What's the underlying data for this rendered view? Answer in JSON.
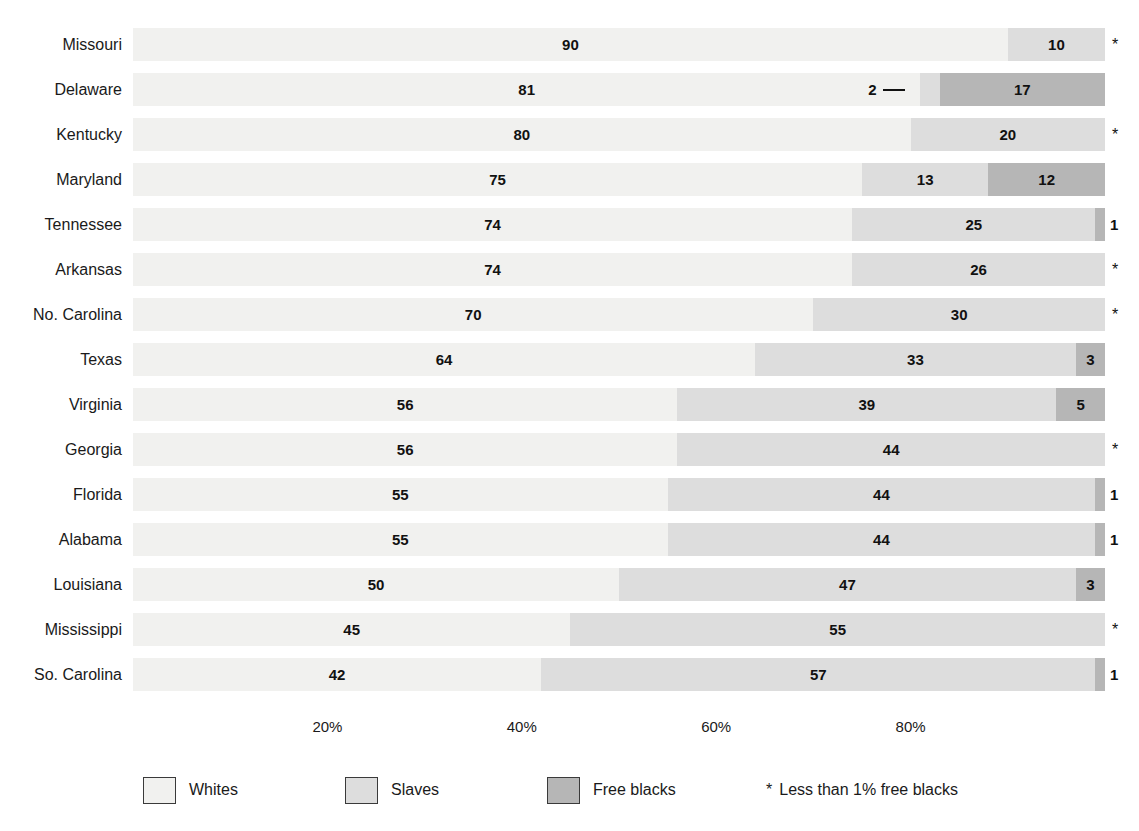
{
  "chart_data": {
    "type": "bar",
    "orientation": "horizontal",
    "stacked": true,
    "title": "",
    "xlabel": "",
    "ylabel": "",
    "xlim": [
      0,
      100
    ],
    "grid": false,
    "legend_position": "bottom",
    "categories": [
      "Missouri",
      "Delaware",
      "Kentucky",
      "Maryland",
      "Tennessee",
      "Arkansas",
      "No. Carolina",
      "Texas",
      "Virginia",
      "Georgia",
      "Florida",
      "Alabama",
      "Louisiana",
      "Mississippi",
      "So. Carolina"
    ],
    "series": [
      {
        "name": "Whites",
        "color": "#f1f1ef",
        "values": [
          90,
          81,
          80,
          75,
          74,
          74,
          70,
          64,
          56,
          56,
          55,
          55,
          50,
          45,
          42
        ]
      },
      {
        "name": "Slaves",
        "color": "#dddddd",
        "values": [
          10,
          2,
          20,
          13,
          25,
          26,
          30,
          33,
          39,
          44,
          44,
          44,
          47,
          55,
          57
        ]
      },
      {
        "name": "Free blacks",
        "color": "#b6b6b6",
        "values": [
          0,
          17,
          0,
          12,
          1,
          0,
          0,
          3,
          5,
          0,
          1,
          1,
          3,
          0,
          1
        ]
      }
    ],
    "xticks": [
      20,
      40,
      60,
      80
    ],
    "xticklabels": [
      "20%",
      "40%",
      "60%",
      "80%"
    ],
    "footnote_symbol": "*",
    "footnote_text": "Less than 1% free blacks"
  },
  "rows": [
    {
      "state": "Missouri",
      "segments": [
        {
          "series": "Whites",
          "value": 90,
          "label": "90",
          "label_position": "inside"
        },
        {
          "series": "Slaves",
          "value": 10,
          "label": "10",
          "label_position": "inside"
        }
      ],
      "marker": "*"
    },
    {
      "state": "Delaware",
      "segments": [
        {
          "series": "Whites",
          "value": 81,
          "label": "81",
          "label_position": "inside"
        },
        {
          "series": "Slaves",
          "value": 2,
          "label": "2",
          "label_position": "callout"
        },
        {
          "series": "Free blacks",
          "value": 17,
          "label": "17",
          "label_position": "inside"
        }
      ],
      "marker": ""
    },
    {
      "state": "Kentucky",
      "segments": [
        {
          "series": "Whites",
          "value": 80,
          "label": "80",
          "label_position": "inside"
        },
        {
          "series": "Slaves",
          "value": 20,
          "label": "20",
          "label_position": "inside"
        }
      ],
      "marker": "*"
    },
    {
      "state": "Maryland",
      "segments": [
        {
          "series": "Whites",
          "value": 75,
          "label": "75",
          "label_position": "inside"
        },
        {
          "series": "Slaves",
          "value": 13,
          "label": "13",
          "label_position": "inside"
        },
        {
          "series": "Free blacks",
          "value": 12,
          "label": "12",
          "label_position": "inside"
        }
      ],
      "marker": ""
    },
    {
      "state": "Tennessee",
      "segments": [
        {
          "series": "Whites",
          "value": 74,
          "label": "74",
          "label_position": "inside"
        },
        {
          "series": "Slaves",
          "value": 25,
          "label": "25",
          "label_position": "inside"
        },
        {
          "series": "Free blacks",
          "value": 1,
          "label": "1",
          "label_position": "outside"
        }
      ],
      "marker": ""
    },
    {
      "state": "Arkansas",
      "segments": [
        {
          "series": "Whites",
          "value": 74,
          "label": "74",
          "label_position": "inside"
        },
        {
          "series": "Slaves",
          "value": 26,
          "label": "26",
          "label_position": "inside"
        }
      ],
      "marker": "*"
    },
    {
      "state": "No. Carolina",
      "segments": [
        {
          "series": "Whites",
          "value": 70,
          "label": "70",
          "label_position": "inside"
        },
        {
          "series": "Slaves",
          "value": 30,
          "label": "30",
          "label_position": "inside"
        }
      ],
      "marker": "*"
    },
    {
      "state": "Texas",
      "segments": [
        {
          "series": "Whites",
          "value": 64,
          "label": "64",
          "label_position": "inside"
        },
        {
          "series": "Slaves",
          "value": 33,
          "label": "33",
          "label_position": "inside"
        },
        {
          "series": "Free blacks",
          "value": 3,
          "label": "3",
          "label_position": "inside"
        }
      ],
      "marker": ""
    },
    {
      "state": "Virginia",
      "segments": [
        {
          "series": "Whites",
          "value": 56,
          "label": "56",
          "label_position": "inside"
        },
        {
          "series": "Slaves",
          "value": 39,
          "label": "39",
          "label_position": "inside"
        },
        {
          "series": "Free blacks",
          "value": 5,
          "label": "5",
          "label_position": "inside"
        }
      ],
      "marker": ""
    },
    {
      "state": "Georgia",
      "segments": [
        {
          "series": "Whites",
          "value": 56,
          "label": "56",
          "label_position": "inside"
        },
        {
          "series": "Slaves",
          "value": 44,
          "label": "44",
          "label_position": "inside"
        }
      ],
      "marker": "*"
    },
    {
      "state": "Florida",
      "segments": [
        {
          "series": "Whites",
          "value": 55,
          "label": "55",
          "label_position": "inside"
        },
        {
          "series": "Slaves",
          "value": 44,
          "label": "44",
          "label_position": "inside"
        },
        {
          "series": "Free blacks",
          "value": 1,
          "label": "1",
          "label_position": "outside"
        }
      ],
      "marker": ""
    },
    {
      "state": "Alabama",
      "segments": [
        {
          "series": "Whites",
          "value": 55,
          "label": "55",
          "label_position": "inside"
        },
        {
          "series": "Slaves",
          "value": 44,
          "label": "44",
          "label_position": "inside"
        },
        {
          "series": "Free blacks",
          "value": 1,
          "label": "1",
          "label_position": "outside"
        }
      ],
      "marker": ""
    },
    {
      "state": "Louisiana",
      "segments": [
        {
          "series": "Whites",
          "value": 50,
          "label": "50",
          "label_position": "inside"
        },
        {
          "series": "Slaves",
          "value": 47,
          "label": "47",
          "label_position": "inside"
        },
        {
          "series": "Free blacks",
          "value": 3,
          "label": "3",
          "label_position": "inside"
        }
      ],
      "marker": ""
    },
    {
      "state": "Mississippi",
      "segments": [
        {
          "series": "Whites",
          "value": 45,
          "label": "45",
          "label_position": "inside"
        },
        {
          "series": "Slaves",
          "value": 55,
          "label": "55",
          "label_position": "inside"
        }
      ],
      "marker": "*"
    },
    {
      "state": "So. Carolina",
      "segments": [
        {
          "series": "Whites",
          "value": 42,
          "label": "42",
          "label_position": "inside"
        },
        {
          "series": "Slaves",
          "value": 57,
          "label": "57",
          "label_position": "inside"
        },
        {
          "series": "Free blacks",
          "value": 1,
          "label": "1",
          "label_position": "outside"
        }
      ],
      "marker": ""
    }
  ],
  "axis": {
    "ticks": [
      {
        "value": 20,
        "label": "20%"
      },
      {
        "value": 40,
        "label": "40%"
      },
      {
        "value": 60,
        "label": "60%"
      },
      {
        "value": 80,
        "label": "80%"
      }
    ]
  },
  "legend": {
    "items": [
      {
        "label": "Whites",
        "color": "#f1f1ef",
        "swatch_class": "sw-whites",
        "left": 143
      },
      {
        "label": "Slaves",
        "color": "#dddddd",
        "swatch_class": "sw-slaves",
        "left": 345
      },
      {
        "label": "Free blacks",
        "color": "#b6b6b6",
        "swatch_class": "sw-free",
        "left": 547
      }
    ],
    "note_symbol": "*",
    "note_text": "Less than 1% free blacks",
    "note_left": 766
  }
}
